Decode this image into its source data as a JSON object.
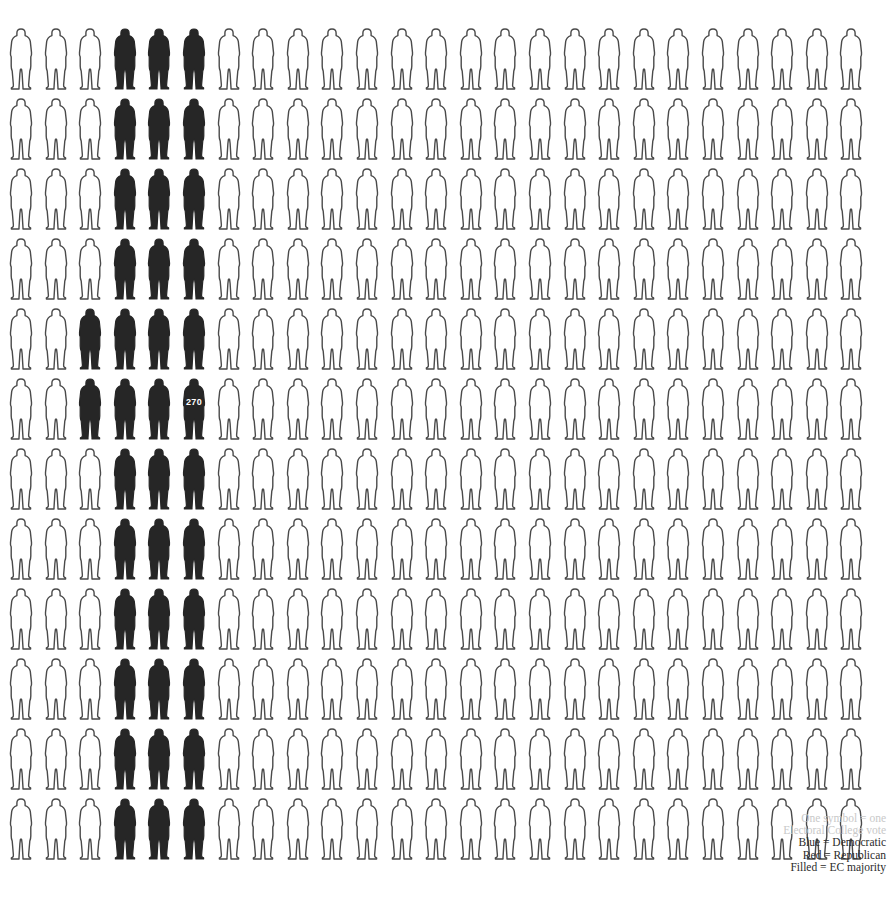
{
  "chart_data": {
    "type": "pictogram",
    "title": "",
    "subtitle": "",
    "xlabel": "",
    "ylabel": "",
    "symbol": "person",
    "unit_per_symbol": 1,
    "unit_name": "Electoral College vote",
    "total_symbols": 300,
    "columns": 25,
    "rows": 12,
    "filled_count": 44,
    "outline_count": 256,
    "threshold_marker": {
      "label": "270",
      "row": 6,
      "column": 6,
      "meaning": "Electoral College majority threshold"
    },
    "rows_data": [
      {
        "row": 1,
        "filled_columns": [
          4,
          5,
          6
        ],
        "filled": 3,
        "outline": 22
      },
      {
        "row": 2,
        "filled_columns": [
          4,
          5,
          6
        ],
        "filled": 3,
        "outline": 22
      },
      {
        "row": 3,
        "filled_columns": [
          4,
          5,
          6
        ],
        "filled": 3,
        "outline": 22
      },
      {
        "row": 4,
        "filled_columns": [
          4,
          5,
          6
        ],
        "filled": 3,
        "outline": 22
      },
      {
        "row": 5,
        "filled_columns": [
          3,
          4,
          5,
          6
        ],
        "filled": 4,
        "outline": 21
      },
      {
        "row": 6,
        "filled_columns": [
          3,
          4,
          5,
          6
        ],
        "filled": 4,
        "outline": 21
      },
      {
        "row": 7,
        "filled_columns": [
          4,
          5,
          6
        ],
        "filled": 3,
        "outline": 22
      },
      {
        "row": 8,
        "filled_columns": [
          4,
          5,
          6
        ],
        "filled": 3,
        "outline": 22
      },
      {
        "row": 9,
        "filled_columns": [
          4,
          5,
          6
        ],
        "filled": 3,
        "outline": 22
      },
      {
        "row": 10,
        "filled_columns": [
          4,
          5,
          6
        ],
        "filled": 3,
        "outline": 22
      },
      {
        "row": 11,
        "filled_columns": [
          4,
          5,
          6
        ],
        "filled": 3,
        "outline": 22
      },
      {
        "row": 12,
        "filled_columns": [
          4,
          5,
          6
        ],
        "filled": 3,
        "outline": 22
      }
    ],
    "legend_position": "bottom-right",
    "grid": false
  },
  "legend": {
    "lines": [
      {
        "text": "One symbol = one",
        "faint": true
      },
      {
        "text": "Electoral College vote",
        "faint": true
      },
      {
        "text": "Blue = Democratic",
        "faint": false
      },
      {
        "text": "Red = Republican",
        "faint": false
      },
      {
        "text": "Filled  = EC majority",
        "faint": false
      }
    ]
  },
  "colors": {
    "filled": "#262626",
    "outline_stroke": "#4a4a4a",
    "outline_fill": "#ffffff",
    "background": "#ffffff",
    "marker_text": "#ffffff",
    "legend_text": "#2b2b2b",
    "legend_faint_text": "#c9c9c9"
  },
  "layout": {
    "origin_x": 8,
    "origin_y": 28,
    "col_step": 34.6,
    "row_step": 70.0,
    "figure_width": 26,
    "figure_height": 62
  }
}
